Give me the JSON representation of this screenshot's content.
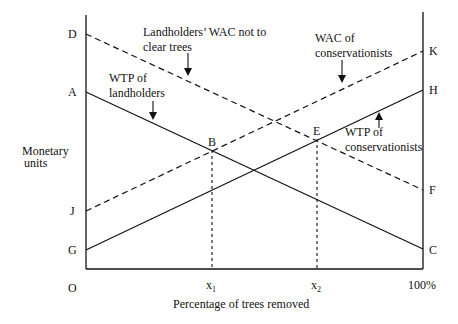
{
  "diagram": {
    "type": "economic-willingness-diagram",
    "y_axis_label_line1": "Monetary",
    "y_axis_label_line2": "units",
    "x_axis_label": "Percentage of trees removed",
    "origin_label": "O",
    "x_ticks": {
      "x1": "x",
      "x1_sub": "1",
      "x2": "x",
      "x2_sub": "2",
      "end": "100%"
    },
    "left_points": {
      "D": "D",
      "A": "A",
      "J": "J",
      "G": "G"
    },
    "right_points": {
      "K": "K",
      "H": "H",
      "F": "F",
      "C": "C"
    },
    "intersections": {
      "B": "B",
      "E": "E"
    },
    "annotations": {
      "wac_landholders_line1": "Landholders’ WAC not to",
      "wac_landholders_line2": "clear trees",
      "wtp_landholders_line1": "WTP of",
      "wtp_landholders_line2": "landholders",
      "wac_conservationists_line1": "WAC of",
      "wac_conservationists_line2": "conservationists",
      "wtp_conservationists_line1": "WTP of",
      "wtp_conservationists_line2": "conservationists"
    },
    "curves": [
      {
        "name": "Landholders' WAC not to clear trees",
        "from": "D",
        "to": "F",
        "style": "dashed"
      },
      {
        "name": "WTP of landholders",
        "from": "A",
        "to": "C",
        "style": "solid"
      },
      {
        "name": "WAC of conservationists",
        "from": "J",
        "to": "K",
        "style": "dashed"
      },
      {
        "name": "WTP of conservationists",
        "from": "G",
        "to": "H",
        "style": "solid"
      }
    ]
  }
}
